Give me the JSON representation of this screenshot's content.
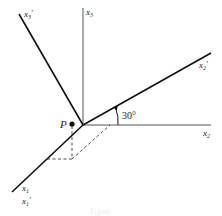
{
  "diagram": {
    "type": "coordinate-axes-rotation",
    "labels": {
      "x1": "x",
      "x1_sub": "1",
      "x1p": "x",
      "x1p_sub": "1",
      "x2": "x",
      "x2_sub": "2",
      "x2p": "x",
      "x2p_sub": "2",
      "x3": "x",
      "x3_sub": "3",
      "x3p": "x",
      "x3p_sub": "3",
      "prime": "′",
      "point": "P",
      "angle": "30°"
    },
    "caption": "Figure"
  }
}
